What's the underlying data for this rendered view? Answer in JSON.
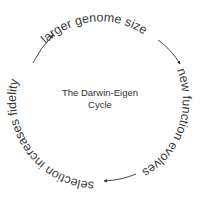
{
  "diagram": {
    "title_line1": "The Darwin-Eigen",
    "title_line2": "Cycle",
    "stages": [
      {
        "label": "larger genome size"
      },
      {
        "label": "new function evolves"
      },
      {
        "label": "selection increases fidelity"
      }
    ],
    "colors": {
      "text": "#3a3a3a",
      "arrow": "#333333",
      "background": "#ffffff"
    }
  }
}
